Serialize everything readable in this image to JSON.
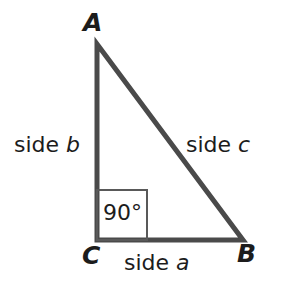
{
  "figure": {
    "background_color": "#ffffff",
    "stroke_color": "#4a4a4a",
    "box_stroke_color": "#595959",
    "text_color": "#1c1c1c"
  },
  "vertices": {
    "a": {
      "label": "A",
      "x": 97,
      "y": 44
    },
    "b": {
      "label": "B",
      "x": 243,
      "y": 240
    },
    "c": {
      "label": "C",
      "x": 97,
      "y": 240
    }
  },
  "sides": {
    "a": {
      "label_static": "side",
      "label_variable": "a"
    },
    "b": {
      "label_static": "side",
      "label_variable": "b"
    },
    "c": {
      "label_static": "side",
      "label_variable": "c"
    }
  },
  "right_angle": {
    "label": "90°",
    "box_x": 97,
    "box_y": 190,
    "box_size": 50
  },
  "chart_data": {
    "type": "diagram",
    "shape": "right-triangle",
    "points": [
      {
        "name": "A",
        "x": 97,
        "y": 44
      },
      {
        "name": "C",
        "x": 97,
        "y": 240
      },
      {
        "name": "B",
        "x": 243,
        "y": 240
      }
    ],
    "edges": [
      {
        "from": "A",
        "to": "C",
        "label": "side b"
      },
      {
        "from": "C",
        "to": "B",
        "label": "side a"
      },
      {
        "from": "B",
        "to": "A",
        "label": "side c"
      }
    ],
    "annotations": [
      {
        "text": "90°",
        "at": "C",
        "type": "right-angle-marker"
      }
    ]
  }
}
